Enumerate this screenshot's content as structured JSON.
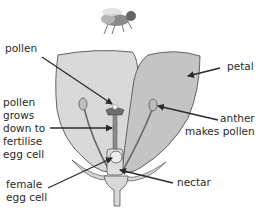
{
  "diagram": {
    "labels": {
      "pollen": "pollen",
      "pollen_tube": "pollen\ngrows\ndown to\nfertilise\negg cell",
      "female_egg_cell": "female\negg cell",
      "petal": "petal",
      "anther": "anther\nmakes pollen",
      "nectar": "nectar"
    },
    "icons": [
      "bee-icon"
    ],
    "colors": {
      "petal_left": "#d9d9d9",
      "petal_right": "#c4c4c4",
      "outline": "#555555",
      "stigma": "#6e6e6e",
      "arrow": "#2a2a2a",
      "text": "#2a2a2a"
    }
  }
}
